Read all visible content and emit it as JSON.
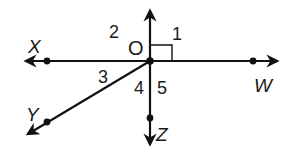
{
  "diagram": {
    "type": "geometry-angles",
    "center_point": "O",
    "points": {
      "X": "X",
      "W": "W",
      "Y": "Y",
      "Z": "Z",
      "O": "O"
    },
    "rays": [
      {
        "from": "O",
        "through": "X"
      },
      {
        "from": "O",
        "through": "W"
      },
      {
        "from": "O",
        "through": "Y"
      },
      {
        "from": "O",
        "through": "Z"
      },
      {
        "from": "O",
        "direction": "up"
      }
    ],
    "angle_labels": [
      "1",
      "2",
      "3",
      "4",
      "5"
    ],
    "right_angle_marker": "angle 1",
    "stroke_color": "#111111",
    "text_color": "#1a1a1a",
    "background_color": "#ffffff"
  }
}
